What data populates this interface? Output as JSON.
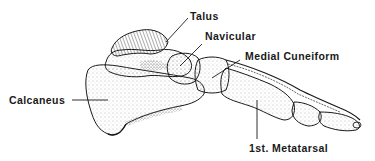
{
  "diagram": {
    "labels": {
      "talus": "Talus",
      "navicular": "Navicular",
      "medial_cuneiform": "Medial Cuneiform",
      "calcaneus": "Calcaneus",
      "first_metatarsal": "1st. Metatarsal"
    }
  },
  "colors": {
    "ink": "#1a1a1a",
    "stipple": "#555555",
    "background": "#ffffff"
  }
}
